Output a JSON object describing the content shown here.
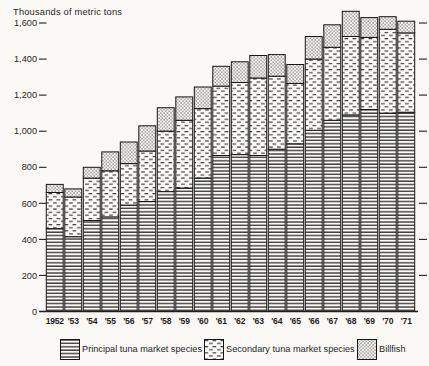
{
  "title": "Thousands of metric tons",
  "colors": {
    "ink": "#1f1f1f",
    "paper": "#faf9f5"
  },
  "axes": {
    "y_tick_labels": [
      "0",
      "200",
      "400",
      "600",
      "800",
      "1,000",
      "1,200",
      "1,400",
      "1,600"
    ],
    "y_tick_values": [
      0,
      200,
      400,
      600,
      800,
      1000,
      1200,
      1400,
      1600
    ],
    "x_labels": [
      "1952",
      "'53",
      "'54",
      "'55",
      "'56",
      "'57",
      "'58",
      "'59",
      "'60",
      "'61",
      "'62",
      "'63",
      "'64",
      "'65",
      "'66",
      "'67",
      "'68",
      "'69",
      "'70",
      "'71"
    ]
  },
  "legend": {
    "items": [
      {
        "label": "Principal tuna market species",
        "pattern": "hlines"
      },
      {
        "label": "Secondary tuna market species",
        "pattern": "dashes"
      },
      {
        "label": "Billfish",
        "pattern": "dots"
      }
    ]
  },
  "chart_data": {
    "type": "bar",
    "stacked": true,
    "title": "Thousands of metric tons",
    "ylabel": "Thousands of metric tons",
    "xlabel": "",
    "ylim": [
      0,
      1600
    ],
    "grid": false,
    "legend_position": "bottom",
    "categories": [
      1952,
      1953,
      1954,
      1955,
      1956,
      1957,
      1958,
      1959,
      1960,
      1961,
      1962,
      1963,
      1964,
      1965,
      1966,
      1967,
      1968,
      1969,
      1970,
      1971
    ],
    "series": [
      {
        "name": "Principal tuna market species",
        "pattern": "hlines",
        "values": [
          460,
          415,
          505,
          525,
          590,
          610,
          665,
          685,
          740,
          865,
          870,
          865,
          900,
          930,
          1005,
          1060,
          1090,
          1120,
          1100,
          1105
        ]
      },
      {
        "name": "Secondary tuna market species",
        "pattern": "dashes",
        "values": [
          200,
          220,
          235,
          255,
          230,
          280,
          335,
          375,
          385,
          385,
          400,
          430,
          405,
          335,
          395,
          405,
          435,
          400,
          465,
          440
        ]
      },
      {
        "name": "Billfish",
        "pattern": "dots",
        "values": [
          45,
          45,
          60,
          105,
          120,
          140,
          130,
          130,
          120,
          110,
          115,
          125,
          120,
          105,
          125,
          125,
          140,
          110,
          70,
          65
        ]
      }
    ],
    "totals": [
      705,
      680,
      800,
      885,
      940,
      1030,
      1130,
      1190,
      1245,
      1360,
      1385,
      1420,
      1425,
      1370,
      1525,
      1590,
      1665,
      1630,
      1635,
      1610
    ]
  }
}
